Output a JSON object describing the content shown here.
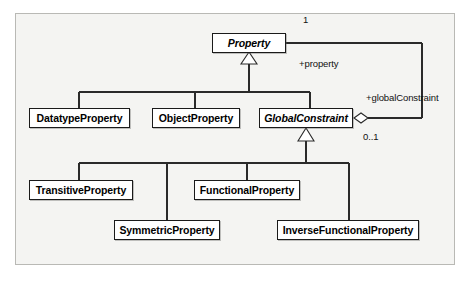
{
  "diagram": {
    "kind": "uml-class-diagram",
    "frame": {
      "border_color": "#b9b9b5",
      "background": "#f4f4f2"
    },
    "classes": [
      {
        "id": "property",
        "name": "Property",
        "abstract": true,
        "x": 212,
        "y": 33,
        "w": 74,
        "h": 20
      },
      {
        "id": "datatype-property",
        "name": "DatatypeProperty",
        "abstract": false,
        "x": 29,
        "y": 108,
        "w": 101,
        "h": 20
      },
      {
        "id": "object-property",
        "name": "ObjectProperty",
        "abstract": false,
        "x": 152,
        "y": 108,
        "w": 88,
        "h": 20
      },
      {
        "id": "global-constraint",
        "name": "GlobalConstraint",
        "abstract": true,
        "x": 259,
        "y": 108,
        "w": 94,
        "h": 20
      },
      {
        "id": "transitive-property",
        "name": "TransitiveProperty",
        "abstract": false,
        "x": 29,
        "y": 180,
        "w": 104,
        "h": 20
      },
      {
        "id": "functional-property",
        "name": "FunctionalProperty",
        "abstract": false,
        "x": 194,
        "y": 180,
        "w": 106,
        "h": 20
      },
      {
        "id": "symmetric-property",
        "name": "SymmetricProperty",
        "abstract": false,
        "x": 114,
        "y": 220,
        "w": 106,
        "h": 20
      },
      {
        "id": "inverse-functional-property",
        "name": "InverseFunctionalProperty",
        "abstract": false,
        "x": 277,
        "y": 220,
        "w": 142,
        "h": 20
      }
    ],
    "labels": [
      {
        "id": "multiplicity-one",
        "text": "1",
        "x": 303,
        "y": 14
      },
      {
        "id": "role-property",
        "text": "+property",
        "x": 299,
        "y": 58
      },
      {
        "id": "role-globalconstraint",
        "text": "+globalConstraint",
        "x": 366,
        "y": 92
      },
      {
        "id": "multiplicity-zero-one",
        "text": "0..1",
        "x": 363,
        "y": 131
      }
    ],
    "generalizations": [
      {
        "id": "gen-property",
        "parent": "property",
        "children": [
          "datatype-property",
          "object-property",
          "global-constraint"
        ]
      },
      {
        "id": "gen-globalconstraint",
        "parent": "global-constraint",
        "children": [
          "transitive-property",
          "functional-property",
          "symmetric-property",
          "inverse-functional-property"
        ]
      }
    ],
    "associations": [
      {
        "id": "assoc-property-globalconstraint",
        "from": "global-constraint",
        "to": "property",
        "from_end_decoration": "aggregation-diamond",
        "from_role": "+globalConstraint",
        "from_multiplicity": "0..1",
        "to_role": "+property",
        "to_multiplicity": "1"
      }
    ]
  }
}
